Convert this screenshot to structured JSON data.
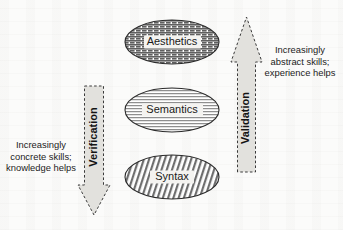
{
  "diagram": {
    "background_color": "#fbfbfa",
    "ellipses": [
      {
        "id": "aesthetics",
        "label": "Aesthetics",
        "pattern": "brick-crosshatch",
        "pattern_description": "dense offset brick / basket weave hatch",
        "fill_color": "#8d8d8d",
        "stroke_color": "#2b2b2b",
        "cx": 172,
        "cy": 42,
        "rx": 47,
        "ry": 22
      },
      {
        "id": "semantics",
        "label": "Semantics",
        "pattern": "horizontal-lines",
        "pattern_description": "fine closely spaced horizontal lines",
        "fill_color": "#b9b9b9",
        "stroke_color": "#2b2b2b",
        "cx": 172,
        "cy": 110,
        "rx": 47,
        "ry": 22
      },
      {
        "id": "syntax",
        "label": "Syntax",
        "pattern": "diagonal-hatch",
        "pattern_description": "steep right-leaning diagonal hatch lines",
        "fill_color": "#9e9e9e",
        "stroke_color": "#2b2b2b",
        "cx": 172,
        "cy": 177,
        "rx": 47,
        "ry": 22
      }
    ],
    "arrows": [
      {
        "id": "verification",
        "label": "Verification",
        "direction": "down",
        "style": "dashed-outline",
        "fill_color": "#e2e1dd",
        "stroke_color": "#3a3a3a"
      },
      {
        "id": "validation",
        "label": "Validation",
        "direction": "up",
        "style": "dashed-outline",
        "fill_color": "#e2e1dd",
        "stroke_color": "#3a3a3a"
      }
    ],
    "captions": {
      "left": {
        "id": "concrete-skills-caption",
        "lines": [
          "Increasingly",
          "concrete skills;",
          "knowledge helps"
        ]
      },
      "right": {
        "id": "abstract-skills-caption",
        "lines": [
          "Increasingly",
          "abstract skills;",
          "experience helps"
        ]
      }
    }
  }
}
